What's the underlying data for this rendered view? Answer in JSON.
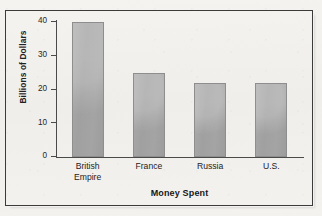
{
  "figure": {
    "title": "Costs of the War for the Allies",
    "title_clipped": true
  },
  "chart_data": {
    "type": "bar",
    "title": "Costs of the War for the Allies",
    "categories": [
      "British Empire",
      "France",
      "Russia",
      "U.S."
    ],
    "values": [
      40,
      25,
      22,
      22
    ],
    "xlabel": "Money Spent",
    "ylabel": "Billions of Dollars",
    "ylim": [
      0,
      40
    ],
    "yticks": [
      0,
      10,
      20,
      30,
      40
    ],
    "ytick_labels": [
      "0",
      "10",
      "20",
      "30",
      "40"
    ],
    "grid": false,
    "legend": false,
    "orientation": "vertical",
    "bar_color": "#a8a8a8",
    "bar_edge_color": "#8e8e8e",
    "axis_color": "#4a4a4a",
    "background_color": "#f2f1ee",
    "frame_color": "#3b3b3b"
  },
  "axis": {
    "y_title": "Billions of Dollars",
    "x_title": "Money Spent"
  },
  "bars": [
    {
      "label_line1": "British",
      "label_line2": "Empire",
      "value": 40
    },
    {
      "label_line1": "France",
      "label_line2": "",
      "value": 25
    },
    {
      "label_line1": "Russia",
      "label_line2": "",
      "value": 22
    },
    {
      "label_line1": "U.S.",
      "label_line2": "",
      "value": 22
    }
  ]
}
